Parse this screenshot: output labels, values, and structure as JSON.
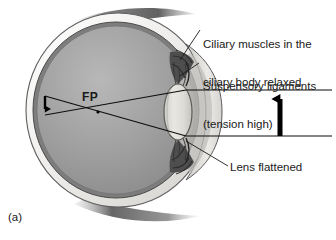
{
  "figure": {
    "panel_letter": "(a)",
    "labels": {
      "ciliary_line1": "Ciliary muscles in the",
      "ciliary_line2": "ciliary body relaxed",
      "suspensory_line1": "Suspensory ligaments",
      "suspensory_line2": "(tension high)",
      "lens": "Lens flattened",
      "focal_point": "FP"
    },
    "icons": {
      "object_arrow": "up-arrow-icon",
      "image_arrow": "down-arrow-icon"
    },
    "colors": {
      "sclera_outer": "#f2f1ef",
      "sclera_shade": "#d8d6d2",
      "choroid": "#6f6f6f",
      "vitreous": "#9b9b9b",
      "vitreous_light": "#b3b3b3",
      "lens_fill": "#dddcd6",
      "lens_edge": "#6a6a66",
      "cornea": "#c9c8c4",
      "ciliary_body": "#4b4b4b",
      "ray_line": "#101010",
      "label_text": "#1a1a1a",
      "background": "#ffffff"
    },
    "geometry": {
      "eye_center": [
        118,
        110
      ],
      "eye_radius_x": 92,
      "eye_radius_y": 97,
      "lens_center": [
        178,
        112
      ],
      "lens_rx": 14,
      "lens_ry": 28,
      "focal_point": [
        98,
        112
      ],
      "object_arrow_x": 280,
      "object_arrow_top_y": 90,
      "object_arrow_bottom_y": 136,
      "image_arrow_x": 45,
      "image_arrow_top_y": 96,
      "image_arrow_bottom_y": 115,
      "ray_top_y": 90,
      "ray_bottom_y": 136,
      "ray_right_x": 332
    }
  }
}
